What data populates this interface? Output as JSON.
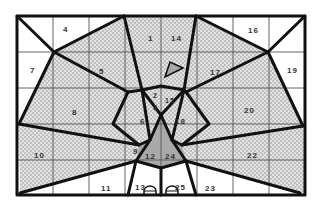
{
  "diagram": {
    "type": "tangram-style dissection puzzle (peacock)",
    "frame": {
      "x": 17,
      "y": 16,
      "width": 288,
      "height": 179
    },
    "grid": {
      "columns": 8,
      "rows": 5
    },
    "colors": {
      "background": "#ffffff",
      "dotted_fill": "#e2e2e2",
      "dot": "#8a8a8a",
      "gray_fill": "#a9a9a9",
      "line": "#111111",
      "grid_line": "#555555"
    },
    "pieces": [
      {
        "id": "1",
        "label": "1",
        "x": 148,
        "y": 41
      },
      {
        "id": "2",
        "label": "2",
        "x": 154,
        "y": 93
      },
      {
        "id": "3",
        "label": "3",
        "x": 155,
        "y": 104
      },
      {
        "id": "4",
        "label": "4",
        "x": 63,
        "y": 32
      },
      {
        "id": "5",
        "label": "5",
        "x": 99,
        "y": 74
      },
      {
        "id": "6",
        "label": "6",
        "x": 142,
        "y": 122
      },
      {
        "id": "7",
        "label": "7",
        "x": 30,
        "y": 73
      },
      {
        "id": "8",
        "label": "8",
        "x": 72,
        "y": 115
      },
      {
        "id": "9",
        "label": "9",
        "x": 137,
        "y": 152
      },
      {
        "id": "10",
        "label": "10",
        "x": 34,
        "y": 158
      },
      {
        "id": "11",
        "label": "11",
        "x": 101,
        "y": 192
      },
      {
        "id": "12",
        "label": "12",
        "x": 147,
        "y": 157
      },
      {
        "id": "13",
        "label": "13",
        "x": 135,
        "y": 192
      },
      {
        "id": "14",
        "label": "14",
        "x": 172,
        "y": 41
      },
      {
        "id": "15",
        "label": "15",
        "x": 170,
        "y": 101
      },
      {
        "id": "16",
        "label": "16",
        "x": 251,
        "y": 33
      },
      {
        "id": "17",
        "label": "17",
        "x": 211,
        "y": 75
      },
      {
        "id": "18",
        "label": "18",
        "x": 180,
        "y": 122
      },
      {
        "id": "19",
        "label": "19",
        "x": 290,
        "y": 73
      },
      {
        "id": "20",
        "label": "20",
        "x": 249,
        "y": 114
      },
      {
        "id": "22",
        "label": "22",
        "x": 254,
        "y": 158
      },
      {
        "id": "23",
        "label": "23",
        "x": 206,
        "y": 192
      },
      {
        "id": "24",
        "label": "24",
        "x": 167,
        "y": 157
      },
      {
        "id": "25",
        "label": "25",
        "x": 175,
        "y": 192
      }
    ]
  }
}
